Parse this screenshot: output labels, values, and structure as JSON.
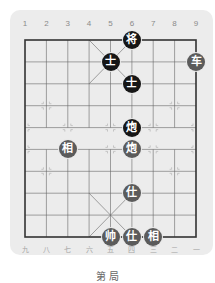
{
  "board": {
    "column_numbers_top": [
      "1",
      "2",
      "3",
      "4",
      "5",
      "6",
      "7",
      "8",
      "9"
    ],
    "column_numbers_bottom": [
      "九",
      "八",
      "七",
      "六",
      "五",
      "四",
      "三",
      "二",
      "一"
    ],
    "colors": {
      "panel": "#ececec",
      "lines": "#555555",
      "black_piece": "#161616",
      "red_piece": "#5b5b5b"
    }
  },
  "pieces": [
    {
      "label": "将",
      "side": "black",
      "col": 6,
      "row": 0
    },
    {
      "label": "士",
      "side": "black",
      "col": 5,
      "row": 1
    },
    {
      "label": "车",
      "side": "red",
      "col": 9,
      "row": 1
    },
    {
      "label": "士",
      "side": "black",
      "col": 6,
      "row": 2
    },
    {
      "label": "炮",
      "side": "black",
      "col": 6,
      "row": 4
    },
    {
      "label": "相",
      "side": "red",
      "col": 3,
      "row": 5
    },
    {
      "label": "炮",
      "side": "red",
      "col": 6,
      "row": 5
    },
    {
      "label": "仕",
      "side": "red",
      "col": 6,
      "row": 7
    },
    {
      "label": "帅",
      "side": "red",
      "col": 5,
      "row": 9
    },
    {
      "label": "仕",
      "side": "red",
      "col": 6,
      "row": 9
    },
    {
      "label": "相",
      "side": "red",
      "col": 7,
      "row": 9
    }
  ],
  "caption": "第 局"
}
